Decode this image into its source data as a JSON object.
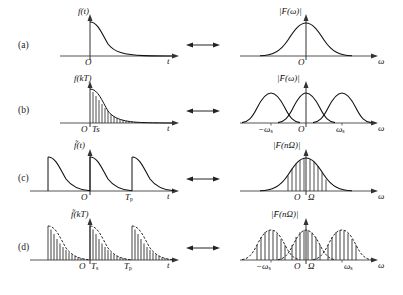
{
  "figure": {
    "title": "",
    "relation_symbol": "double-headed-arrow",
    "rows": [
      {
        "id": "a",
        "label": "(a)",
        "left": {
          "name": "continuous-time-signal",
          "ylabel": "f(t)",
          "ylabel_base": "f",
          "ylabel_arg": "(t)",
          "xlabel": "t",
          "origin": "O",
          "ticks": [],
          "kind": "continuous-exponential-decay"
        },
        "right": {
          "name": "continuous-spectrum",
          "ylabel": "|F(ω)|",
          "ylabel_base": "F",
          "ylabel_arg": "(ω)",
          "xlabel": "ω",
          "origin": "O",
          "ticks": [],
          "kind": "single-bell"
        }
      },
      {
        "id": "b",
        "label": "(b)",
        "left": {
          "name": "sampled-time-signal",
          "ylabel": "f(kT)",
          "ylabel_base": "f",
          "ylabel_arg": "(kT)",
          "xlabel": "t",
          "origin": "O",
          "ticks": [
            "T",
            "s"
          ],
          "tick_label": "Ts",
          "kind": "sampled-exponential-decay"
        },
        "right": {
          "name": "periodic-spectrum",
          "ylabel": "|F̄(ω)|",
          "ylabel_base": "F",
          "ylabel_arg": "(ω)",
          "xlabel": "ω",
          "origin": "O",
          "ticks": [
            "-ωs",
            "ωs"
          ],
          "tick_left": "−ω",
          "tick_right": "ω",
          "tick_sub": "s",
          "kind": "repeated-bells"
        }
      },
      {
        "id": "c",
        "label": "(c)",
        "left": {
          "name": "periodic-time-signal",
          "ylabel": "f̃(t)",
          "ylabel_base": "f",
          "ylabel_arg": "(t)",
          "xlabel": "t",
          "origin": "O",
          "ticks": [
            "Tp"
          ],
          "tick_label": "T",
          "tick_sub": "p",
          "kind": "periodic-exponential-decay"
        },
        "right": {
          "name": "discrete-spectrum",
          "ylabel": "|F(nΩ)|",
          "ylabel_base": "F",
          "ylabel_arg": "(nΩ)",
          "xlabel": "ω",
          "origin": "O",
          "ticks": [
            "Ω"
          ],
          "tick_label": "Ω",
          "kind": "sampled-bell"
        }
      },
      {
        "id": "d",
        "label": "(d)",
        "left": {
          "name": "periodic-sampled-time-signal",
          "ylabel": "f̃(kT)",
          "ylabel_base": "f",
          "ylabel_arg": "(kT)",
          "xlabel": "t",
          "origin": "O",
          "ticks": [
            "Ts",
            "Tp"
          ],
          "tick_1": "T",
          "tick_1_sub": "s",
          "tick_2": "T",
          "tick_2_sub": "p",
          "kind": "periodic-sampled-exponential-decay"
        },
        "right": {
          "name": "discrete-periodic-spectrum",
          "ylabel": "|F̄(nΩ)|",
          "ylabel_base": "F",
          "ylabel_arg": "(nΩ)",
          "xlabel": "ω",
          "origin": "O",
          "ticks": [
            "-ωs",
            "Ω",
            "ωs"
          ],
          "tick_left": "−ω",
          "tick_sub": "s",
          "tick_mid": "Ω",
          "tick_right": "ω",
          "kind": "repeated-sampled-bells"
        }
      }
    ],
    "colors": {
      "ink": "#1a1a1a",
      "axis": "#555555",
      "curve": "#111111",
      "background": "#ffffff"
    }
  }
}
